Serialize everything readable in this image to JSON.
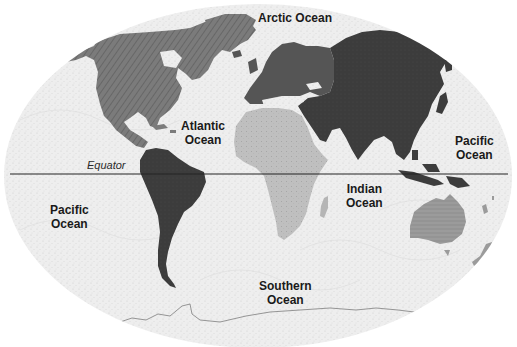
{
  "map": {
    "title": "World continents and oceans",
    "style": "grayscale",
    "colors": {
      "ocean": "#ececec",
      "ocean_stipple": "#d4d4d4",
      "north_america": "#7b7b7b",
      "south_america": "#2f2f2f",
      "europe": "#555555",
      "asia": "#3c3c3c",
      "africa": "#bfbfbf",
      "australia": "#9b9b9b",
      "antarctica_outline": "#8a8a8a",
      "equator_line": "#222222",
      "label_text": "#1a1a1a"
    },
    "equator": {
      "label": "Equator"
    },
    "oceans": [
      {
        "id": "arctic",
        "line1": "Arctic Ocean",
        "line2": ""
      },
      {
        "id": "atlantic",
        "line1": "Atlantic",
        "line2": "Ocean"
      },
      {
        "id": "pacific_east",
        "line1": "Pacific",
        "line2": "Ocean"
      },
      {
        "id": "pacific_west",
        "line1": "Pacific",
        "line2": "Ocean"
      },
      {
        "id": "indian",
        "line1": "Indian",
        "line2": "Ocean"
      },
      {
        "id": "southern",
        "line1": "Southern",
        "line2": "Ocean"
      }
    ],
    "continents": [
      {
        "id": "north_america",
        "fill": "hatched-diagonal"
      },
      {
        "id": "south_america",
        "fill": "solid-dark"
      },
      {
        "id": "europe",
        "fill": "solid"
      },
      {
        "id": "asia",
        "fill": "solid"
      },
      {
        "id": "africa",
        "fill": "stippled-light"
      },
      {
        "id": "australia",
        "fill": "hatched-horizontal"
      },
      {
        "id": "antarctica",
        "fill": "outline"
      }
    ]
  }
}
